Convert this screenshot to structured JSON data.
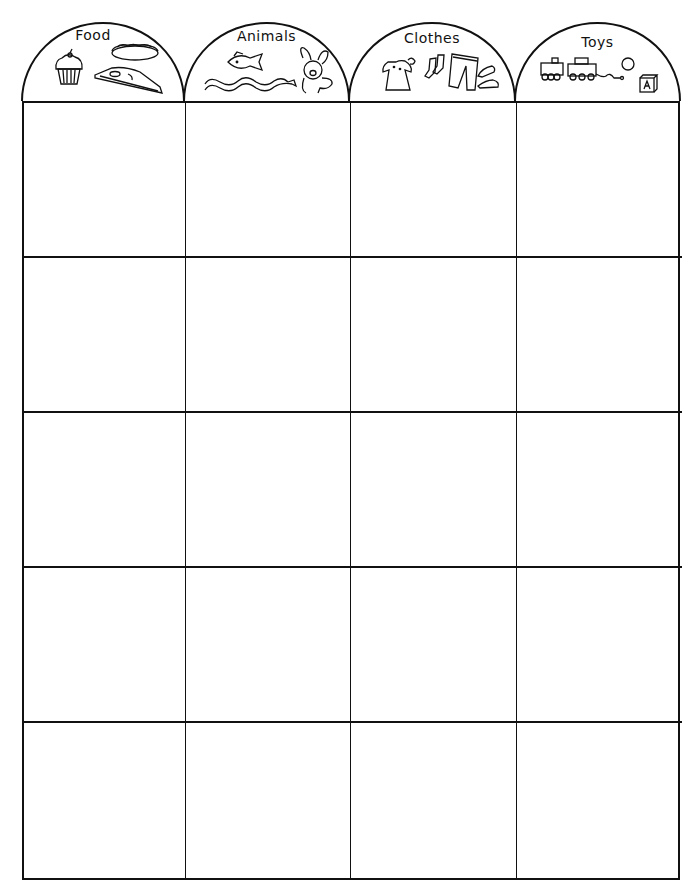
{
  "worksheet": {
    "type": "sorting-chart",
    "columns": [
      {
        "label": "Food",
        "icons": [
          "cupcake-icon",
          "hot-dog-icon",
          "pizza-slice-icon"
        ]
      },
      {
        "label": "Animals",
        "icons": [
          "fish-icon",
          "snake-icon",
          "bunny-icon"
        ]
      },
      {
        "label": "Clothes",
        "icons": [
          "dress-icon",
          "socks-icon",
          "pants-icon",
          "shoes-icon"
        ]
      },
      {
        "label": "Toys",
        "icons": [
          "train-icon",
          "ball-icon",
          "alphabet-block-icon"
        ]
      }
    ],
    "block_letter": "A",
    "rows": 5,
    "line_color": "#111111",
    "background": "#ffffff"
  }
}
